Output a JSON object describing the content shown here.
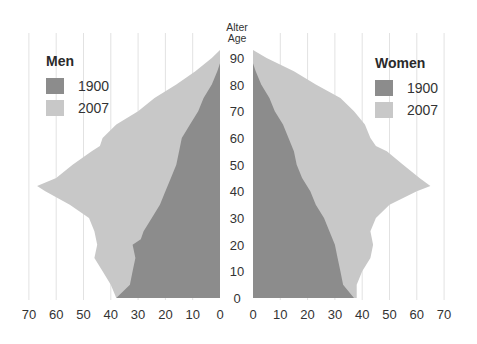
{
  "chart_data": {
    "type": "area",
    "subtype": "population-pyramid",
    "title": "",
    "y_axis_title_line1": "Alter",
    "y_axis_title_line2": "Age",
    "ylabel": "Alter / Age",
    "ylim": [
      0,
      90
    ],
    "y_ticks": [
      "90",
      "80",
      "70",
      "60",
      "50",
      "40",
      "30",
      "20",
      "10",
      "0"
    ],
    "xlim": [
      0,
      70
    ],
    "x_ticks_left": [
      "70",
      "60",
      "50",
      "40",
      "30",
      "20",
      "10",
      "0"
    ],
    "x_ticks_right": [
      "0",
      "10",
      "20",
      "30",
      "40",
      "50",
      "60",
      "70"
    ],
    "grid": "vertical",
    "colors": {
      "1900": "#8c8c8c",
      "2007": "#c8c8c8",
      "grid": "#e2e2e2"
    },
    "panels": {
      "men": {
        "legend_title": "Men",
        "series": [
          {
            "name": "1900",
            "ages": [
              0,
              5,
              10,
              15,
              20,
              22,
              25,
              30,
              35,
              40,
              45,
              50,
              55,
              60,
              65,
              70,
              75,
              80,
              85,
              88
            ],
            "values": [
              38,
              33,
              32,
              31,
              32,
              29,
              28,
              25,
              22,
              20,
              18,
              16,
              15,
              14,
              11,
              8,
              6,
              3,
              1,
              0
            ]
          },
          {
            "name": "2007",
            "ages": [
              0,
              5,
              10,
              15,
              20,
              25,
              30,
              35,
              40,
              42,
              45,
              50,
              55,
              57,
              60,
              65,
              70,
              75,
              80,
              85,
              90,
              93
            ],
            "values": [
              38,
              40,
              43,
              46,
              45,
              46,
              48,
              55,
              64,
              67,
              60,
              54,
              47,
              44,
              43,
              38,
              30,
              24,
              16,
              9,
              3,
              0
            ]
          }
        ]
      },
      "women": {
        "legend_title": "Women",
        "series": [
          {
            "name": "1900",
            "ages": [
              0,
              5,
              10,
              15,
              20,
              25,
              30,
              35,
              40,
              45,
              50,
              55,
              60,
              65,
              70,
              75,
              80,
              85,
              88
            ],
            "values": [
              37,
              33,
              32,
              31,
              30,
              28,
              26,
              23,
              21,
              18,
              16,
              15,
              13,
              11,
              8,
              6,
              3,
              1,
              0
            ]
          },
          {
            "name": "2007",
            "ages": [
              0,
              5,
              10,
              15,
              20,
              25,
              30,
              35,
              40,
              42,
              45,
              50,
              55,
              57,
              60,
              65,
              70,
              75,
              80,
              85,
              90,
              93
            ],
            "values": [
              38,
              38,
              40,
              43,
              44,
              43,
              45,
              50,
              60,
              65,
              61,
              55,
              49,
              45,
              43,
              41,
              37,
              32,
              23,
              15,
              5,
              0
            ]
          }
        ]
      }
    }
  },
  "legend": {
    "men": {
      "title": "Men",
      "items": [
        {
          "label": "1900"
        },
        {
          "label": "2007"
        }
      ]
    },
    "women": {
      "title": "Women",
      "items": [
        {
          "label": "1900"
        },
        {
          "label": "2007"
        }
      ]
    }
  }
}
